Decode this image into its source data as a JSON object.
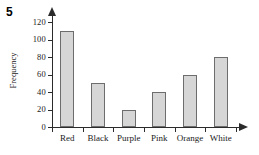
{
  "question_number": "5",
  "chart_data": {
    "type": "bar",
    "title": "",
    "xlabel": "",
    "ylabel": "Frequency",
    "categories": [
      "Red",
      "Black",
      "Purple",
      "Pink",
      "Orange",
      "White"
    ],
    "values": [
      110,
      50,
      20,
      40,
      60,
      80
    ],
    "ylim": [
      0,
      120
    ],
    "ytick_labels": [
      "0",
      "20",
      "40",
      "60",
      "80",
      "100",
      "120"
    ],
    "ytick_values": [
      0,
      20,
      40,
      60,
      80,
      100,
      120
    ],
    "grid": false,
    "legend": false,
    "legend_position": "none",
    "bar_fill_color": "#d6d6d6",
    "bar_edge_color": "#6d6d6d",
    "axis_color": "#2b2b2b"
  }
}
